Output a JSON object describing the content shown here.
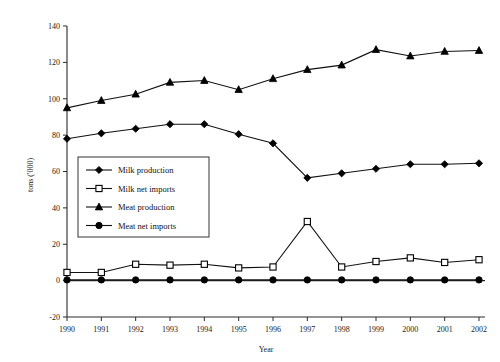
{
  "chart_data": {
    "type": "line",
    "title": "",
    "xlabel": "Year",
    "ylabel": "tons ('000)",
    "xlim": [
      1990,
      2002
    ],
    "ylim": [
      -20,
      140
    ],
    "ytick_step": 20,
    "grid": false,
    "legend_position": "center-left",
    "categories": [
      1990,
      1991,
      1992,
      1993,
      1994,
      1995,
      1996,
      1997,
      1998,
      1999,
      2000,
      2001,
      2002
    ],
    "xticklabels": [
      "1990",
      "1991",
      "1992",
      "1993",
      "1994",
      "1995",
      "1996",
      "1997",
      "1998",
      "1999",
      "2000",
      "2001",
      "2002"
    ],
    "yticklabels": [
      "-20",
      "0",
      "20",
      "40",
      "60",
      "80",
      "100",
      "120",
      "140"
    ],
    "yticks": [
      -20,
      0,
      20,
      40,
      60,
      80,
      100,
      120,
      140
    ],
    "series": [
      {
        "name": "Milk production",
        "marker": "filled-diamond",
        "values": [
          78,
          81,
          83.5,
          86,
          86,
          80.5,
          75.5,
          56.5,
          59,
          61.5,
          64,
          64,
          64.5
        ]
      },
      {
        "name": "Milk net imports",
        "marker": "open-square",
        "values": [
          4.5,
          4.5,
          9,
          8.5,
          9,
          7,
          7.5,
          32.5,
          7.5,
          10.5,
          12.5,
          10,
          11.5
        ]
      },
      {
        "name": "Meat production",
        "marker": "filled-triangle",
        "values": [
          95,
          99,
          102.5,
          109,
          110,
          105,
          111,
          116,
          118.5,
          127,
          123.5,
          126,
          126.5
        ]
      },
      {
        "name": "Meat net imports",
        "marker": "filled-circle",
        "values": [
          0.4,
          0.4,
          0.4,
          0.4,
          0.4,
          0.4,
          0.4,
          0.4,
          0.4,
          0.4,
          0.4,
          0.4,
          0.4
        ]
      }
    ],
    "colors": {
      "line": "#111111",
      "axis": "#2a2a2a",
      "legend_border": "#333333",
      "background": "#ffffff"
    }
  }
}
